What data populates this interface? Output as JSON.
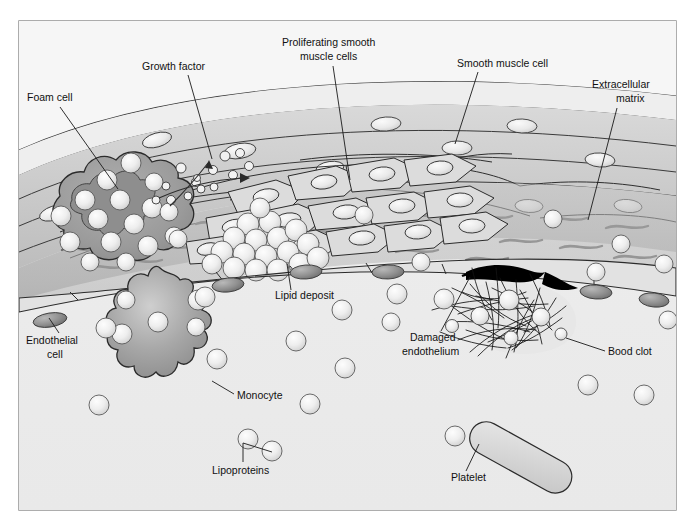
{
  "figure": {
    "frame": {
      "x": 19,
      "y": 21,
      "width": 657,
      "height": 489,
      "border_color": "#8a8a8a",
      "fill_color": "#f2f2f2"
    }
  },
  "labels": [
    {
      "id": "foam-cell",
      "text": "Foam cell",
      "x": 27,
      "y": 101,
      "anchor": "start",
      "leader": [
        [
          60,
          107
        ],
        [
          118,
          189
        ]
      ]
    },
    {
      "id": "growth-factor",
      "text": "Growth factor",
      "x": 142,
      "y": 70,
      "anchor": "start",
      "leader": [
        [
          188,
          75
        ],
        [
          212,
          159
        ]
      ]
    },
    {
      "id": "proliferating-smooth-muscle-cells",
      "text": "Proliferating smooth",
      "text2": "muscle cells",
      "x": 282,
      "y": 46,
      "x2": 300,
      "y2": 60,
      "anchor": "start",
      "leader": [
        [
          333,
          66
        ],
        [
          350,
          180
        ]
      ]
    },
    {
      "id": "smooth-muscle-cell",
      "text": "Smooth muscle cell",
      "x": 457,
      "y": 67,
      "anchor": "start",
      "leader": [
        [
          478,
          72
        ],
        [
          455,
          144
        ]
      ]
    },
    {
      "id": "extracellular-matrix",
      "text": "Extracellular",
      "text2": "matrix",
      "x": 592,
      "y": 88,
      "x2": 610,
      "y2": 102,
      "anchor": "start",
      "leader": [
        [
          617,
          108
        ],
        [
          588,
          220
        ]
      ]
    },
    {
      "id": "lipid-deposit",
      "text": "Lipid deposit",
      "x": 275,
      "y": 297,
      "anchor": "start",
      "leader": [
        [
          291,
          290
        ],
        [
          287,
          266
        ]
      ]
    },
    {
      "id": "endothelial-cell",
      "text": "Endothelial",
      "text2": "cell",
      "x": 26,
      "y": 340,
      "x2": 47,
      "y2": 354,
      "anchor": "start",
      "leader": [
        [
          59,
          333
        ],
        [
          49,
          318
        ]
      ]
    },
    {
      "id": "monocyte",
      "text": "Monocyte",
      "x": 237,
      "y": 399,
      "anchor": "start",
      "leader": [
        [
          234,
          394
        ],
        [
          214,
          381
        ]
      ]
    },
    {
      "id": "lipoproteins",
      "text": "Lipoproteins",
      "x": 212,
      "y": 471,
      "anchor": "start",
      "leader": [
        [
          243,
          462
        ],
        [
          243,
          443
        ],
        [
          272,
          452
        ]
      ]
    },
    {
      "id": "damaged-endothelium",
      "text": "Damaged",
      "text2": "endothelium",
      "x": 408,
      "y": 339,
      "x2": 402,
      "y2": 353,
      "anchor": "start",
      "leader": [
        [
          441,
          331
        ],
        [
          470,
          277
        ]
      ]
    },
    {
      "id": "bood-clot",
      "text": "Bood clot",
      "x": 608,
      "y": 355,
      "anchor": "start",
      "leader": [
        [
          605,
          351
        ],
        [
          568,
          338
        ]
      ]
    },
    {
      "id": "platelet",
      "text": "Platelet",
      "x": 451,
      "y": 479,
      "anchor": "start",
      "leader": [
        [
          466,
          471
        ],
        [
          478,
          443
        ]
      ]
    }
  ],
  "colors": {
    "background": "#ffffff",
    "panel_fill": "#f2f2f2",
    "panel_border": "#8a8a8a",
    "lumen": "#ececec",
    "adventitia_light": "#eaeaea",
    "media_mid": "#c9c9c9",
    "media_dark": "#b4b4b4",
    "intima_plaque": "#b9b9b9",
    "foam_cell": "#9a9a9a",
    "foam_cell_core": "#8c8c8c",
    "monocyte": "#9e9e9e",
    "lipid_sphere": "#e8e8e8",
    "lipoprotein": "#e4e4e4",
    "nucleus": "#ececec",
    "dark_nucleus": "#8f8f8f",
    "clot_fiber": "#1a1a1a",
    "endothelial_gap": "#000000",
    "outline": "#2b2b2b",
    "text": "#111111"
  },
  "structures": [
    {
      "name": "adventitia-layer",
      "kind": "band"
    },
    {
      "name": "media-layer",
      "kind": "band"
    },
    {
      "name": "intima-plaque",
      "kind": "region"
    },
    {
      "name": "lumen",
      "kind": "region"
    },
    {
      "name": "foam-cell",
      "kind": "cell"
    },
    {
      "name": "monocyte",
      "kind": "cell"
    },
    {
      "name": "lipid-deposit-cluster",
      "kind": "cluster"
    },
    {
      "name": "blood-clot",
      "kind": "cluster"
    },
    {
      "name": "platelet",
      "kind": "cell"
    },
    {
      "name": "lipoprotein-particles",
      "kind": "particles"
    },
    {
      "name": "growth-factor-particles",
      "kind": "particles"
    },
    {
      "name": "smooth-muscle-cells",
      "kind": "cells"
    },
    {
      "name": "extracellular-matrix-fibers",
      "kind": "fibers"
    },
    {
      "name": "damaged-endothelium-gap",
      "kind": "defect"
    }
  ]
}
